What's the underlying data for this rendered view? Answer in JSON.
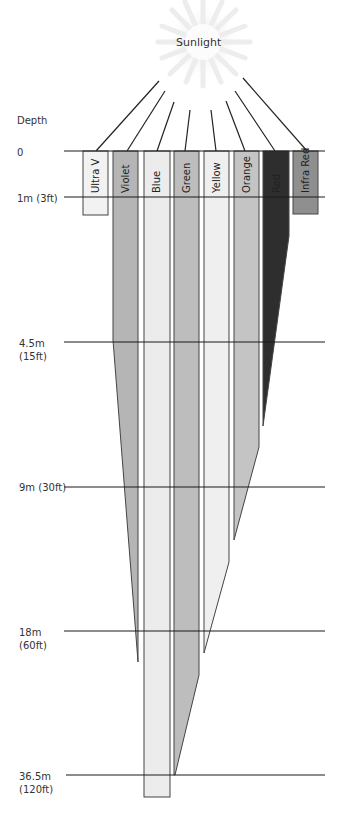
{
  "title": "Sunlight",
  "axis_label": "Depth",
  "depths": [
    {
      "label": "0",
      "y": 151
    },
    {
      "label": "1m (3ft)",
      "y": 197
    },
    {
      "label": "4.5m\n(15ft)",
      "line1": "4.5m",
      "line2": "(15ft)",
      "y": 342
    },
    {
      "label": "9m (30ft)",
      "y": 487
    },
    {
      "label": "18m\n(60ft)",
      "line1": "18m",
      "line2": "(60ft)",
      "y": 631
    },
    {
      "label": "36.5m\n(120ft)",
      "line1": "36.5m",
      "line2": "(120ft)",
      "y": 775
    }
  ],
  "bands": [
    {
      "name": "Ultra V",
      "color": "#f2f2f2",
      "penetration": "1m (3ft)"
    },
    {
      "name": "Violet",
      "color": "#b5b5b5",
      "penetration": "18m (60ft)"
    },
    {
      "name": "Blue",
      "color": "#ececec",
      "penetration": "beyond 36.5m (120ft)"
    },
    {
      "name": "Green",
      "color": "#bdbdbd",
      "penetration": "36.5m (120ft)"
    },
    {
      "name": "Yellow",
      "color": "#efefef",
      "penetration": "18m (60ft)"
    },
    {
      "name": "Orange",
      "color": "#c4c4c4",
      "penetration": "9m (30ft)"
    },
    {
      "name": "Red",
      "color": "#2e2e2e",
      "penetration": "4.5m (15ft)"
    },
    {
      "name": "Infra Red",
      "color": "#8f8f8f",
      "penetration": "1m (3ft)"
    }
  ],
  "labels": {
    "d0": "0",
    "d1": "1m (3ft)",
    "d2a": "4.5m",
    "d2b": "(15ft)",
    "d3": "9m (30ft)",
    "d4a": "18m",
    "d4b": "(60ft)",
    "d5a": "36.5m",
    "d5b": "(120ft)",
    "uv": "Ultra V",
    "violet": "Violet",
    "blue": "Blue",
    "green": "Green",
    "yellow": "Yellow",
    "orange": "Orange",
    "red": "Red",
    "ir": "Infra Red"
  }
}
